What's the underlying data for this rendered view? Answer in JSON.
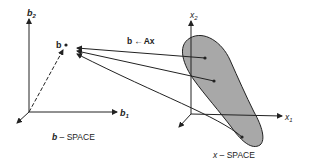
{
  "diagram": {
    "colors": {
      "ink": "#222222",
      "region_fill": "#a8a8a8",
      "background": "#ffffff"
    },
    "b_space": {
      "caption": "b – SPACE",
      "caption_var": "b",
      "caption_rest": " – SPACE",
      "axis_b1_label": "b",
      "axis_b1_sub": "1",
      "axis_b2_label": "b",
      "axis_b2_sub": "2",
      "point_label": "b"
    },
    "mapping_label": "b ←Ax",
    "mapping_label_lhs": "b",
    "mapping_label_arrow": "←",
    "mapping_label_rhs": "Ax",
    "x_space": {
      "caption_var": "x",
      "caption_rest": " – SPACE",
      "axis_x1_label": "x",
      "axis_x1_sub": "1",
      "axis_x2_label": "x",
      "axis_x2_sub": "2",
      "region": "shaded set of x vectors",
      "points_in_region": 3
    },
    "arrows_count": 3
  }
}
